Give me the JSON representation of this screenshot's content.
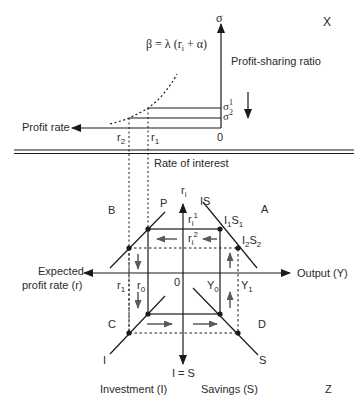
{
  "top_panel": {
    "corner_label": "X",
    "y_axis_label": "σ",
    "y_axis_title": "Profit-sharing ratio",
    "x_axis_title": "Profit rate",
    "origin": "0",
    "curve_formula": "β = λ (r",
    "curve_formula_sub": "i",
    "curve_formula_tail": " + α)",
    "sigma1": "σ",
    "sigma1_sup": "1",
    "sigma2": "σ",
    "sigma2_sup": "2",
    "r1": "r",
    "r1_sub": "1",
    "r2": "r",
    "r2_sub": "2"
  },
  "separator_label": "Rate of interest",
  "bottom_panel": {
    "quadrant_a": "A",
    "quadrant_b": "B",
    "quadrant_c": "C",
    "quadrant_d": "D",
    "corner_label": "Z",
    "y_axis_label": "r",
    "y_axis_label_sub": "i",
    "y_axis_bottom_label": "I = S",
    "x_axis_right_label": "Output (Y)",
    "x_axis_left_label_line1": "Expected",
    "x_axis_left_label_line2": "profit rate (r)",
    "origin": "0",
    "curve_p": "P",
    "curve_is": "IS",
    "curve_i": "I",
    "curve_s": "S",
    "ri1": "r",
    "ri1_sub": "i",
    "ri1_sup": "1",
    "ri2": "r",
    "ri2_sub": "i",
    "ri2_sup": "2",
    "i1s1_a": "I",
    "i1s1_a_sub": "1",
    "i1s1_b": "S",
    "i1s1_b_sub": "1",
    "i2s2_a": "I",
    "i2s2_a_sub": "2",
    "i2s2_b": "S",
    "i2s2_b_sub": "2",
    "r1": "r",
    "r1_sub": "1",
    "r0": "r",
    "r0_sub": "0",
    "y0": "Y",
    "y0_sub": "0",
    "y1": "Y",
    "y1_sub": "1",
    "investment_label": "Investment (I)",
    "savings_label": "Savings (S)"
  },
  "colors": {
    "line": "#1a1a1a",
    "arrow_gray": "#5a5a5a",
    "text": "#2a2a2a"
  }
}
